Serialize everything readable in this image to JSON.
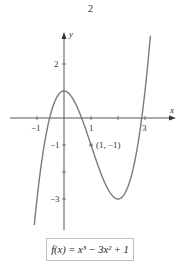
{
  "page_number": "2",
  "figure": {
    "x_axis_label": "x",
    "y_axis_label": "y",
    "x_ticks": [
      {
        "value": -1,
        "label": "−1"
      },
      {
        "value": 1,
        "label": "1"
      },
      {
        "value": 2,
        "label": ""
      },
      {
        "value": 3,
        "label": "3"
      }
    ],
    "y_ticks": [
      {
        "value": 2,
        "label": "2"
      },
      {
        "value": -1,
        "label": "−1"
      },
      {
        "value": -2,
        "label": ""
      },
      {
        "value": -3,
        "label": "−3"
      }
    ],
    "point": {
      "x": 1,
      "y": -1,
      "label": "(1, −1)"
    },
    "formula": "f(x) = x³ − 3x² + 1",
    "curve_color": "#7a7a7a",
    "axis_color": "#555555"
  },
  "chart_data": {
    "type": "line",
    "title": "",
    "function": "f(x) = x^3 - 3x^2 + 1",
    "xlabel": "x",
    "ylabel": "y",
    "xlim": [
      -1.1,
      3.2
    ],
    "ylim": [
      -4,
      3
    ],
    "grid": false,
    "x": [
      -1.1,
      -1.0,
      -0.5,
      0,
      0.5,
      1.0,
      1.5,
      2.0,
      2.5,
      3.0,
      3.2
    ],
    "values": [
      -3.96,
      -3,
      0.125,
      1,
      0.375,
      -1,
      -2.375,
      -3,
      -2.125,
      1,
      3.05
    ],
    "annotations": [
      {
        "x": 1,
        "y": -1,
        "text": "(1, −1)"
      }
    ],
    "x_tick_labels": [
      "−1",
      "1",
      "3"
    ],
    "y_tick_labels": [
      "2",
      "−1",
      "−3"
    ]
  }
}
